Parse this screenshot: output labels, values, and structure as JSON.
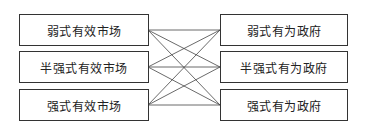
{
  "diagram": {
    "left_column": [
      {
        "label": "弱式有效市场"
      },
      {
        "label": "半强式有效市场"
      },
      {
        "label": "强式有效市场"
      }
    ],
    "right_column": [
      {
        "label": "弱式有为政府"
      },
      {
        "label": "半强式有为政府"
      },
      {
        "label": "强式有为政府"
      }
    ],
    "connections": "all-to-all (each left box connected to every right box)",
    "colors": {
      "border": "#333333",
      "line": "#444444",
      "background": "#ffffff"
    }
  }
}
